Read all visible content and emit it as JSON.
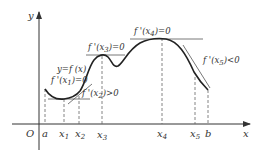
{
  "diagram": {
    "axes": {
      "x_label": "x",
      "y_label": "y",
      "origin_label": "O"
    },
    "x_ticks": [
      {
        "label": "a",
        "sub": ""
      },
      {
        "label": "x",
        "sub": "1"
      },
      {
        "label": "x",
        "sub": "2"
      },
      {
        "label": "x",
        "sub": "3"
      },
      {
        "label": "x",
        "sub": "4"
      },
      {
        "label": "x",
        "sub": "5"
      },
      {
        "label": "b",
        "sub": ""
      }
    ],
    "annotations": {
      "curve": "y=f (x)",
      "x1": {
        "pre": "f '(x",
        "sub": "1",
        "post": ")=0"
      },
      "x2": {
        "pre": "f '(x",
        "sub": "2",
        "post": ")>0"
      },
      "x3": {
        "pre": "f '(x",
        "sub": "3",
        "post": ")=0"
      },
      "x4": {
        "pre": "f '(x",
        "sub": "4",
        "post": ")=0"
      },
      "x5": {
        "pre": "f '(x",
        "sub": "5",
        "post": ")<0"
      }
    },
    "colors": {
      "curve": "#222222",
      "axis": "#333333",
      "tangent": "#555555",
      "guide": "#666666"
    }
  }
}
